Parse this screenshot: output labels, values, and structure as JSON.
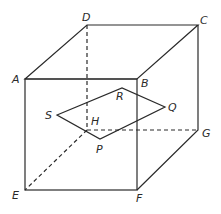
{
  "diagram": {
    "type": "cube-cross-section",
    "vertices": {
      "A": "A",
      "B": "B",
      "C": "C",
      "D": "D",
      "E": "E",
      "F": "F",
      "G": "G",
      "H": "H"
    },
    "section_points": {
      "P": "P",
      "Q": "Q",
      "R": "R",
      "S": "S"
    },
    "edges_solid": [
      "AB",
      "BC",
      "CD",
      "DA",
      "AE",
      "EF",
      "FB",
      "FG",
      "GC"
    ],
    "edges_hidden": [
      "DH",
      "HE",
      "HG"
    ],
    "section_polygon": [
      "S",
      "R",
      "Q",
      "P"
    ]
  }
}
